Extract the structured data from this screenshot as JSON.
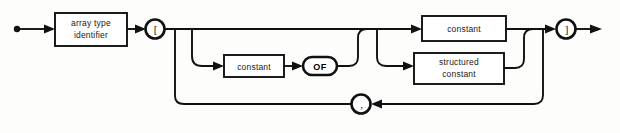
{
  "diagram": {
    "kind": "railroad-syntax-diagram",
    "name": "array constructor syntax diagram",
    "background_color": "#fdfdfc",
    "line_color": "#111111",
    "box_fill_color": "#ffffff",
    "start_marker": "filled-dot",
    "end_marker": "arrowhead",
    "nodes": {
      "array_type_identifier": {
        "label_line1": "array type",
        "label_line2": "identifier",
        "shape": "rectangle"
      },
      "open_bracket": {
        "label": "[",
        "shape": "circle"
      },
      "close_bracket": {
        "label": "]",
        "shape": "circle"
      },
      "comma": {
        "label": ",",
        "shape": "circle"
      },
      "repeat_constant": {
        "label": "constant",
        "shape": "rectangle"
      },
      "of_keyword": {
        "label": "OF",
        "shape": "stadium"
      },
      "value_constant": {
        "label": "constant",
        "shape": "rectangle"
      },
      "structured_constant": {
        "label_line1": "structured",
        "label_line2": "constant",
        "shape": "rectangle"
      }
    }
  }
}
